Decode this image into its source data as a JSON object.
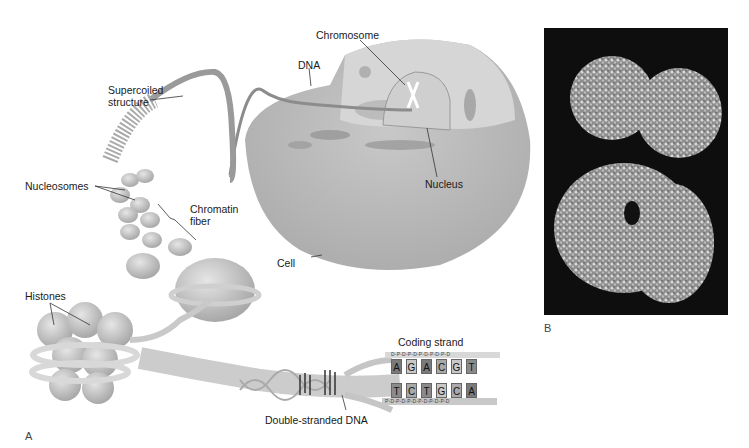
{
  "figure": {
    "panel_a_letter": "A",
    "panel_b_letter": "B",
    "labels": {
      "supercoiled": [
        "Supercoiled",
        "structure"
      ],
      "dna": "DNA",
      "chromosome": "Chromosome",
      "nucleus": "Nucleus",
      "cell": "Cell",
      "nucleosomes": "Nucleosomes",
      "chromatin": [
        "Chromatin",
        "fiber"
      ],
      "histones": "Histones",
      "coding_strand": "Coding strand",
      "double_stranded": "Double-stranded DNA"
    },
    "coding_strand": {
      "top_backbone": "D-P-D-P-D-P-D-P-D-P-D",
      "bottom_backbone": "P-D-P-D-P-D-P-D-P-D-P-D",
      "top_bases": [
        "A",
        "G",
        "A",
        "C",
        "G",
        "T"
      ],
      "bottom_bases": [
        "T",
        "C",
        "T",
        "G",
        "C",
        "A"
      ]
    },
    "colors": {
      "cell_gray": "#b9b9b9",
      "dark_base": "#7a7a7a",
      "light_base": "#c8c8c8",
      "sem_background": "#0e0e0e"
    }
  }
}
